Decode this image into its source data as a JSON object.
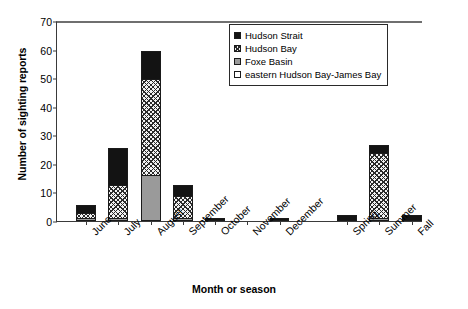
{
  "chart_data": {
    "type": "bar",
    "stacked": true,
    "title": "",
    "xlabel": "Month or season",
    "ylabel": "Number of sighting reports",
    "ylim": [
      0,
      70
    ],
    "ytick_step": 10,
    "yticks": [
      0,
      10,
      20,
      30,
      40,
      50,
      60,
      70
    ],
    "grid": false,
    "legend_position": "top-right",
    "categories": [
      "June",
      "July",
      "August",
      "September",
      "October",
      "November",
      "December",
      "Spring",
      "Summer",
      "Fall"
    ],
    "series": [
      {
        "name": "Foxe Basin",
        "color": "#9a9a9a",
        "pattern": "solid-gray",
        "values": [
          1,
          1,
          16,
          1,
          0,
          0,
          0,
          0,
          1,
          0
        ]
      },
      {
        "name": "Hudson Bay",
        "color": "#f2f2f2",
        "pattern": "cross-hatch",
        "values": [
          2,
          12,
          34,
          8,
          0,
          0,
          0,
          0,
          23,
          0
        ]
      },
      {
        "name": "Hudson Strait",
        "color": "#131313",
        "pattern": "solid-black",
        "values": [
          3,
          13,
          10,
          4,
          1,
          0,
          1,
          2,
          3,
          2
        ]
      },
      {
        "name": "eastern Hudson Bay-James Bay",
        "color": "#ffffff",
        "pattern": "empty",
        "values": [
          0,
          0,
          0,
          0,
          0,
          0,
          0,
          0,
          0,
          0
        ]
      }
    ],
    "totals": [
      6,
      26,
      60,
      13,
      1,
      0,
      1,
      2,
      27,
      2
    ],
    "legend_entries": [
      {
        "label": "Hudson Strait",
        "swatch": "solid-black"
      },
      {
        "label": "Hudson Bay",
        "swatch": "cross-hatch"
      },
      {
        "label": "Foxe Basin",
        "swatch": "solid-gray"
      },
      {
        "label": "eastern Hudson Bay-James Bay",
        "swatch": "empty"
      }
    ]
  }
}
